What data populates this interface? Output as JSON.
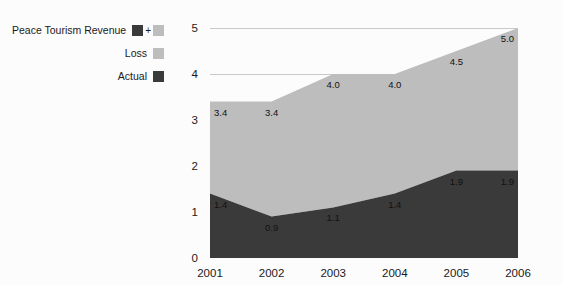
{
  "legend": {
    "rows": [
      {
        "label": "Peace Tourism Revenue",
        "swatches": [
          "dark",
          "light"
        ],
        "combiner": "+"
      },
      {
        "label": "Loss",
        "swatches": [
          "light"
        ],
        "combiner": ""
      },
      {
        "label": "Actual",
        "swatches": [
          "dark"
        ],
        "combiner": ""
      }
    ]
  },
  "colors": {
    "actual": "#3a3a3a",
    "loss": "#bdbdbd",
    "background": "#fcfcfc",
    "gridline": "#c9c9c9",
    "text": "#1a1a1a"
  },
  "chart_data": {
    "type": "area",
    "stacked": true,
    "title": "",
    "subtitle": "",
    "xlabel": "",
    "ylabel": "",
    "categories": [
      "2001",
      "2002",
      "2003",
      "2004",
      "2005",
      "2006"
    ],
    "x": [
      2001,
      2002,
      2003,
      2004,
      2005,
      2006
    ],
    "series": [
      {
        "name": "Actual",
        "color": "#3a3a3a",
        "values": [
          1.4,
          0.9,
          1.1,
          1.4,
          1.9,
          1.9
        ],
        "labels": [
          "1.4",
          "0.9",
          "1.1",
          "1.4",
          "1.9",
          "1.9"
        ]
      },
      {
        "name": "Loss",
        "color": "#bdbdbd",
        "values": [
          2.0,
          2.5,
          2.9,
          2.6,
          2.6,
          3.1
        ],
        "cumulative_top": [
          3.4,
          3.4,
          4.0,
          4.0,
          4.5,
          5.0
        ],
        "labels": [
          "3.4",
          "3.4",
          "4.0",
          "4.0",
          "4.5",
          "5.0"
        ]
      }
    ],
    "ylim": [
      0,
      5
    ],
    "xlim": [
      2001,
      2006
    ],
    "yticks": [
      "0",
      "1",
      "2",
      "3",
      "4",
      "5"
    ],
    "ytick_values": [
      0,
      1,
      2,
      3,
      4,
      5
    ],
    "xticks": [
      "2001",
      "2002",
      "2003",
      "2004",
      "2005",
      "2006"
    ],
    "grid": "horizontal-partial",
    "gridline_values": [
      4,
      5
    ],
    "legend_position": "left"
  }
}
